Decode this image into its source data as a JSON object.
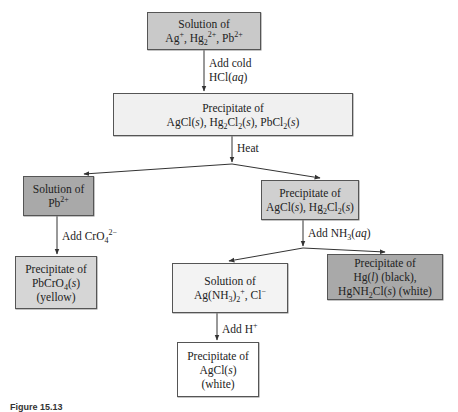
{
  "figure": {
    "caption_partial": "Figure 15.13"
  },
  "colors": {
    "dark_gray": "#a9a9a9",
    "medium_gray": "#c9c9c9",
    "light_gray": "#ececec",
    "white": "#ffffff",
    "line": "#333333"
  },
  "nodes": {
    "start": {
      "line1": "Solution of",
      "line2_html": "Ag<sup>+</sup>, Hg<sub>2</sub><sup>2+</sup>, Pb<sup>2+</sup>",
      "line2": "Ag+, Hg2 2+, Pb2+"
    },
    "precip_all": {
      "line1": "Precipitate of",
      "line2_html": "AgCl(<i>s</i>), Hg<sub>2</sub>Cl<sub>2</sub>(<i>s</i>), PbCl<sub>2</sub>(<i>s</i>)",
      "line2": "AgCl(s), Hg2Cl2(s), PbCl2(s)"
    },
    "sol_pb": {
      "line1": "Solution of",
      "line2_html": "Pb<sup>2+</sup>",
      "line2": "Pb2+"
    },
    "precip_ag_hg": {
      "line1": "Precipitate of",
      "line2_html": "AgCl(<i>s</i>), Hg<sub>2</sub>Cl<sub>2</sub>(<i>s</i>)",
      "line2": "AgCl(s), Hg2Cl2(s)"
    },
    "precip_pbcro4": {
      "line1": "Precipitate of",
      "line2_html": "PbCrO<sub>4</sub>(<i>s</i>)",
      "line2": "PbCrO4(s)",
      "line3": "(yellow)"
    },
    "sol_ag_nh3": {
      "line1": "Solution of",
      "line2_html": "Ag(NH<sub>3</sub>)<sub>2</sub><sup>+</sup>, Cl<sup>−</sup>",
      "line2": "Ag(NH3)2+, Cl−"
    },
    "precip_hg": {
      "line1": "Precipitate of",
      "line2_html": "Hg(<i>l</i>) (black),",
      "line2": "Hg(l) (black),",
      "line3_html": "HgNH<sub>2</sub>Cl(<i>s</i>) (white)",
      "line3": "HgNH2Cl(s) (white)"
    },
    "precip_agcl": {
      "line1": "Precipitate of",
      "line2_html": "AgCl(<i>s</i>)",
      "line2": "AgCl(s)",
      "line3": "(white)"
    }
  },
  "edges": {
    "add_hcl": {
      "line1": "Add cold",
      "line2_html": "HCl(<i>aq</i>)",
      "line2": "HCl(aq)"
    },
    "heat": {
      "label": "Heat"
    },
    "add_cro4": {
      "label_html": "Add CrO<sub>4</sub><sup>2−</sup>",
      "label": "Add CrO4 2−"
    },
    "add_nh3": {
      "label_html": "Add NH<sub>3</sub>(<i>aq</i>)",
      "label": "Add NH3(aq)"
    },
    "add_h": {
      "label_html": "Add H<sup>+</sup>",
      "label": "Add H+"
    }
  }
}
